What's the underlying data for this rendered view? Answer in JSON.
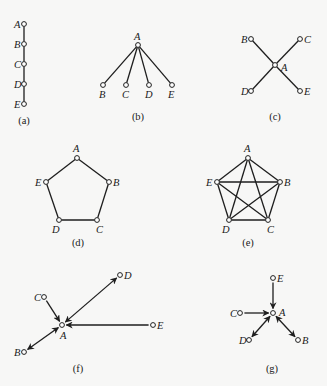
{
  "figure": {
    "panels": [
      {
        "id": "a",
        "caption": "(a)",
        "caption_pos": [
          24,
          124
        ],
        "directed": false,
        "nodes": [
          {
            "id": "A",
            "x": 24,
            "y": 24,
            "lx": 14,
            "ly": 28
          },
          {
            "id": "B",
            "x": 24,
            "y": 44,
            "lx": 14,
            "ly": 48
          },
          {
            "id": "C",
            "x": 24,
            "y": 64,
            "lx": 14,
            "ly": 68
          },
          {
            "id": "D",
            "x": 24,
            "y": 84,
            "lx": 14,
            "ly": 88
          },
          {
            "id": "E",
            "x": 24,
            "y": 104,
            "lx": 14,
            "ly": 108
          }
        ],
        "edges": [
          [
            "A",
            "B"
          ],
          [
            "B",
            "C"
          ],
          [
            "C",
            "D"
          ],
          [
            "D",
            "E"
          ]
        ]
      },
      {
        "id": "b",
        "caption": "(b)",
        "caption_pos": [
          138,
          120
        ],
        "directed": false,
        "nodes": [
          {
            "id": "A",
            "x": 138,
            "y": 45,
            "lx": 134,
            "ly": 40
          },
          {
            "id": "B",
            "x": 103,
            "y": 85,
            "lx": 99,
            "ly": 98
          },
          {
            "id": "C",
            "x": 126,
            "y": 85,
            "lx": 122,
            "ly": 98
          },
          {
            "id": "D",
            "x": 149,
            "y": 85,
            "lx": 145,
            "ly": 98
          },
          {
            "id": "E",
            "x": 172,
            "y": 85,
            "lx": 168,
            "ly": 98
          }
        ],
        "edges": [
          [
            "A",
            "B"
          ],
          [
            "A",
            "C"
          ],
          [
            "A",
            "D"
          ],
          [
            "A",
            "E"
          ]
        ]
      },
      {
        "id": "c",
        "caption": "(c)",
        "caption_pos": [
          275,
          120
        ],
        "directed": false,
        "nodes": [
          {
            "id": "A",
            "x": 275,
            "y": 65,
            "lx": 281,
            "ly": 71
          },
          {
            "id": "B",
            "x": 251,
            "y": 39,
            "lx": 241,
            "ly": 43
          },
          {
            "id": "C",
            "x": 300,
            "y": 39,
            "lx": 304,
            "ly": 43
          },
          {
            "id": "D",
            "x": 251,
            "y": 91,
            "lx": 241,
            "ly": 95
          },
          {
            "id": "E",
            "x": 300,
            "y": 91,
            "lx": 304,
            "ly": 95
          }
        ],
        "edges": [
          [
            "A",
            "B"
          ],
          [
            "A",
            "C"
          ],
          [
            "A",
            "D"
          ],
          [
            "A",
            "E"
          ]
        ]
      },
      {
        "id": "d",
        "caption": "(d)",
        "caption_pos": [
          78,
          246
        ],
        "directed": false,
        "nodes": [
          {
            "id": "A",
            "x": 77,
            "y": 158,
            "lx": 73,
            "ly": 152
          },
          {
            "id": "B",
            "x": 109,
            "y": 182,
            "lx": 113,
            "ly": 186
          },
          {
            "id": "C",
            "x": 97,
            "y": 220,
            "lx": 96,
            "ly": 233
          },
          {
            "id": "D",
            "x": 59,
            "y": 220,
            "lx": 52,
            "ly": 233
          },
          {
            "id": "E",
            "x": 46,
            "y": 182,
            "lx": 35,
            "ly": 186
          }
        ],
        "edges": [
          [
            "A",
            "B"
          ],
          [
            "B",
            "C"
          ],
          [
            "C",
            "D"
          ],
          [
            "D",
            "E"
          ],
          [
            "E",
            "A"
          ]
        ]
      },
      {
        "id": "e",
        "caption": "(e)",
        "caption_pos": [
          248,
          246
        ],
        "directed": false,
        "nodes": [
          {
            "id": "A",
            "x": 248,
            "y": 158,
            "lx": 244,
            "ly": 152
          },
          {
            "id": "B",
            "x": 280,
            "y": 182,
            "lx": 284,
            "ly": 186
          },
          {
            "id": "C",
            "x": 268,
            "y": 220,
            "lx": 267,
            "ly": 233
          },
          {
            "id": "D",
            "x": 229,
            "y": 220,
            "lx": 222,
            "ly": 233
          },
          {
            "id": "E",
            "x": 217,
            "y": 182,
            "lx": 206,
            "ly": 186
          }
        ],
        "edges": [
          [
            "A",
            "B"
          ],
          [
            "A",
            "C"
          ],
          [
            "A",
            "D"
          ],
          [
            "A",
            "E"
          ],
          [
            "B",
            "C"
          ],
          [
            "B",
            "D"
          ],
          [
            "B",
            "E"
          ],
          [
            "C",
            "D"
          ],
          [
            "C",
            "E"
          ],
          [
            "D",
            "E"
          ]
        ]
      },
      {
        "id": "f",
        "caption": "(f)",
        "caption_pos": [
          78,
          372
        ],
        "directed": true,
        "nodes": [
          {
            "id": "A",
            "x": 62,
            "y": 325,
            "lx": 60,
            "ly": 339
          },
          {
            "id": "B",
            "x": 24,
            "y": 352,
            "lx": 14,
            "ly": 356
          },
          {
            "id": "C",
            "x": 44,
            "y": 297,
            "lx": 34,
            "ly": 301
          },
          {
            "id": "D",
            "x": 120,
            "y": 275,
            "lx": 124,
            "ly": 279
          },
          {
            "id": "E",
            "x": 153,
            "y": 325,
            "lx": 157,
            "ly": 329
          }
        ],
        "edges": [
          {
            "from": "C",
            "to": "A",
            "both": false
          },
          {
            "from": "E",
            "to": "A",
            "both": false
          },
          {
            "from": "A",
            "to": "D",
            "both": true
          },
          {
            "from": "A",
            "to": "B",
            "both": true
          }
        ]
      },
      {
        "id": "g",
        "caption": "(g)",
        "caption_pos": [
          272,
          372
        ],
        "directed": true,
        "nodes": [
          {
            "id": "A",
            "x": 273,
            "y": 313,
            "lx": 279,
            "ly": 316
          },
          {
            "id": "B",
            "x": 298,
            "y": 340,
            "lx": 302,
            "ly": 344
          },
          {
            "id": "C",
            "x": 240,
            "y": 313,
            "lx": 230,
            "ly": 317
          },
          {
            "id": "D",
            "x": 249,
            "y": 340,
            "lx": 239,
            "ly": 344
          },
          {
            "id": "E",
            "x": 273,
            "y": 278,
            "lx": 277,
            "ly": 282
          }
        ],
        "edges": [
          {
            "from": "E",
            "to": "A",
            "both": false
          },
          {
            "from": "C",
            "to": "A",
            "both": false
          },
          {
            "from": "A",
            "to": "D",
            "both": true
          },
          {
            "from": "A",
            "to": "B",
            "both": true
          }
        ]
      }
    ]
  }
}
